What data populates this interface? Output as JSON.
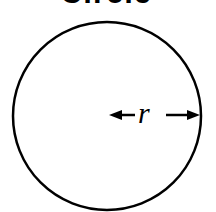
{
  "diagram": {
    "title": "Circle",
    "shape": "circle",
    "radius_label": "r",
    "colors": {
      "stroke": "#000000",
      "background": "#ffffff"
    }
  }
}
